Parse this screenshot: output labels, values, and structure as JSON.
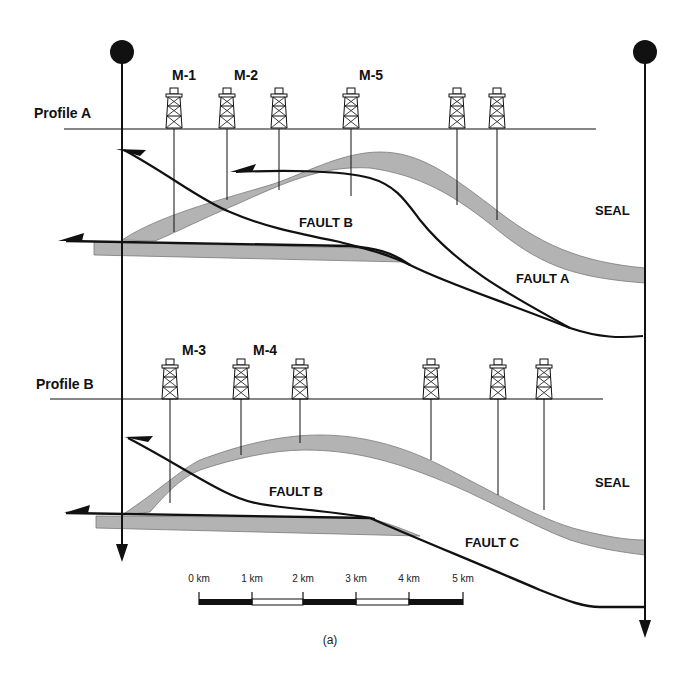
{
  "figure": {
    "caption": "(a)",
    "colors": {
      "seal_fill": "#b3b3b3",
      "seal_edge": "#7a7a7a",
      "line": "#111111",
      "background": "#ffffff"
    }
  },
  "profile_a": {
    "title": "Profile A",
    "wells": [
      {
        "label": "M-1",
        "x": 174
      },
      {
        "label": "M-2",
        "x": 227
      },
      {
        "label": "",
        "x": 279
      },
      {
        "label": "M-5",
        "x": 351
      },
      {
        "label": "",
        "x": 457
      },
      {
        "label": "",
        "x": 497
      }
    ],
    "labels": {
      "fault_b": "FAULT B",
      "fault_a": "FAULT A",
      "seal": "SEAL"
    }
  },
  "profile_b": {
    "title": "Profile B",
    "wells": [
      {
        "label": "M-3",
        "x": 170
      },
      {
        "label": "M-4",
        "x": 241
      },
      {
        "label": "",
        "x": 300
      },
      {
        "label": "",
        "x": 431
      },
      {
        "label": "",
        "x": 498
      },
      {
        "label": "",
        "x": 544
      }
    ],
    "labels": {
      "fault_b": "FAULT B",
      "fault_c": "FAULT C",
      "seal": "SEAL"
    }
  },
  "scale_bar": {
    "ticks": [
      "0 km",
      "1 km",
      "2 km",
      "3 km",
      "4 km",
      "5 km"
    ]
  }
}
